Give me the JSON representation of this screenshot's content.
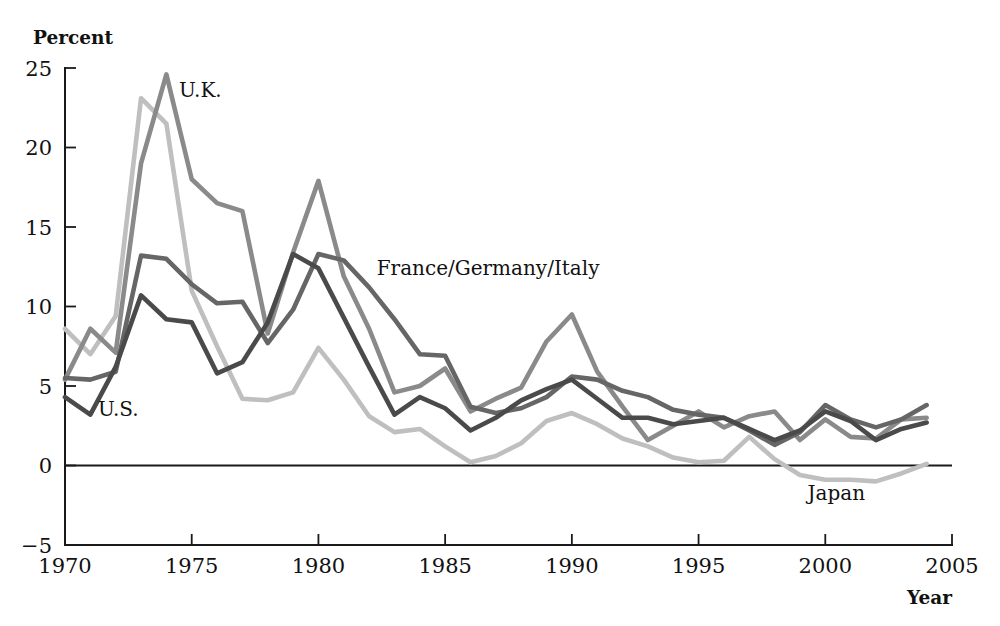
{
  "chart_data": {
    "type": "line",
    "title": "",
    "xlabel": "Year",
    "ylabel": "Percent",
    "xlim": [
      1970,
      2005
    ],
    "ylim": [
      -5,
      25
    ],
    "xticks": [
      1970,
      1975,
      1980,
      1985,
      1990,
      1995,
      2000,
      2005
    ],
    "xtick_labels": [
      "1970",
      "1975",
      "1980",
      "1985",
      "1990",
      "1995",
      "2000",
      "2005"
    ],
    "yticks": [
      -5,
      0,
      5,
      10,
      15,
      20,
      25
    ],
    "ytick_labels": [
      "−5",
      "0",
      "5",
      "10",
      "15",
      "20",
      "25"
    ],
    "grid": false,
    "legend_position": "inline-annotations",
    "zero_line": true,
    "x": [
      1970,
      1971,
      1972,
      1973,
      1974,
      1975,
      1976,
      1977,
      1978,
      1979,
      1980,
      1981,
      1982,
      1983,
      1984,
      1985,
      1986,
      1987,
      1988,
      1989,
      1990,
      1991,
      1992,
      1993,
      1994,
      1995,
      1996,
      1997,
      1998,
      1999,
      2000,
      2001,
      2002,
      2003,
      2004
    ],
    "series": [
      {
        "name": "U.S.",
        "label": "U.S.",
        "color": "#4a4a4a",
        "values": [
          4.3,
          3.2,
          6.2,
          10.7,
          9.2,
          9.0,
          5.8,
          6.5,
          9.0,
          13.3,
          12.4,
          9.3,
          6.2,
          3.2,
          4.3,
          3.6,
          2.2,
          3.0,
          4.1,
          4.8,
          5.4,
          4.2,
          3.0,
          3.0,
          2.6,
          2.8,
          3.0,
          2.3,
          1.6,
          2.2,
          3.4,
          2.8,
          1.6,
          2.3,
          2.7
        ]
      },
      {
        "name": "U.K.",
        "label": "U.K.",
        "color": "#8a8a8a",
        "values": [
          5.4,
          8.6,
          7.1,
          19.0,
          24.6,
          18.0,
          16.5,
          16.0,
          8.3,
          13.4,
          17.9,
          11.9,
          8.6,
          4.6,
          5.0,
          6.1,
          3.4,
          4.2,
          4.9,
          7.8,
          9.5,
          5.9,
          3.7,
          1.6,
          2.5,
          3.4,
          2.4,
          3.1,
          3.4,
          1.6,
          2.9,
          1.8,
          1.7,
          2.9,
          3.0
        ]
      },
      {
        "name": "France/Germany/Italy",
        "label": "France/Germany/Italy",
        "color": "#666666",
        "values": [
          5.5,
          5.4,
          5.9,
          13.2,
          13.0,
          11.4,
          10.2,
          10.3,
          7.7,
          9.8,
          13.3,
          12.9,
          11.2,
          9.2,
          7.0,
          6.9,
          3.7,
          3.3,
          3.6,
          4.3,
          5.6,
          5.4,
          4.7,
          4.3,
          3.5,
          3.2,
          3.0,
          2.2,
          1.3,
          2.1,
          3.8,
          2.9,
          2.4,
          2.9,
          3.8
        ]
      },
      {
        "name": "Japan",
        "label": "Japan",
        "color": "#bfbfbf",
        "values": [
          8.6,
          7.0,
          9.4,
          23.1,
          21.5,
          11.0,
          7.5,
          4.2,
          4.1,
          4.6,
          7.4,
          5.4,
          3.1,
          2.1,
          2.3,
          1.2,
          0.2,
          0.6,
          1.4,
          2.8,
          3.3,
          2.6,
          1.7,
          1.2,
          0.5,
          0.2,
          0.3,
          1.8,
          0.4,
          -0.6,
          -0.9,
          -0.9,
          -1.0,
          -0.5,
          0.1
        ]
      }
    ],
    "annotations": [
      {
        "text": "U.K.",
        "x": 1974.5,
        "y": 23.2,
        "name": "uk"
      },
      {
        "text": "U.S.",
        "x": 1971.3,
        "y": 3.1,
        "name": "us"
      },
      {
        "text": "France/Germany/Italy",
        "x": 1982.3,
        "y": 12.0,
        "name": "fgi"
      },
      {
        "text": "Japan",
        "x": 1999.3,
        "y": -2.2,
        "name": "japan"
      }
    ]
  }
}
